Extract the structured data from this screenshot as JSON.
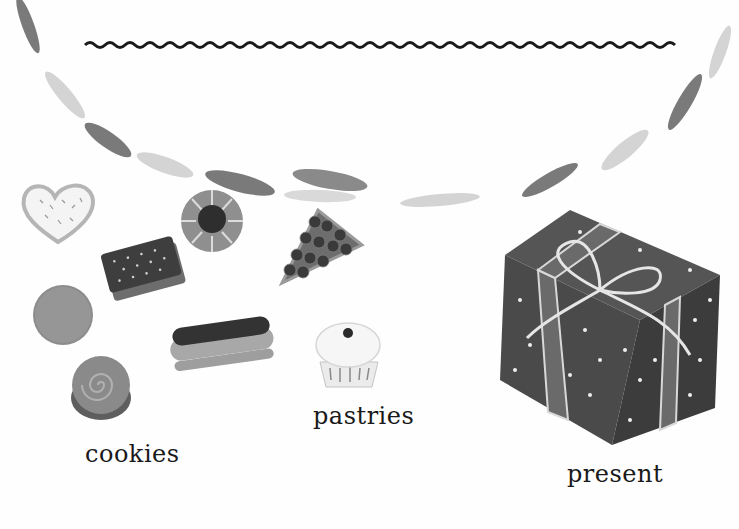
{
  "page": {
    "title_line": "wavy-underline"
  },
  "labels": {
    "cookies": "cookies",
    "pastries": "pastries",
    "present": "present"
  },
  "items": {
    "cookies": [
      "heart-cookie",
      "sandwich-cookie",
      "round-cookie",
      "swirl-cookie"
    ],
    "pastries": [
      "jam-ring-pastry",
      "berry-tart-slice",
      "eclair",
      "cupcake"
    ],
    "present": [
      "gift-box-with-bow"
    ]
  },
  "colors": {
    "ink": "#1a1a1a",
    "garland_dark": "#7a7a7a",
    "garland_light": "#d4d4d4",
    "gift": "#555555",
    "background": "#fefefe"
  }
}
